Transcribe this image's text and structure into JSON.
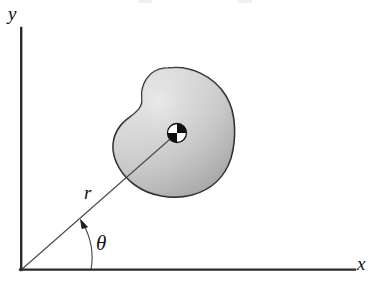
{
  "figure": {
    "background_color": "#ffffff",
    "width": 379,
    "height": 282
  },
  "axes": {
    "origin": {
      "x": 21,
      "y": 270
    },
    "x_axis": {
      "label": "x",
      "label_position": {
        "x": 357,
        "y": 254
      },
      "from": {
        "x": 21,
        "y": 270
      },
      "to": {
        "x": 355,
        "y": 270
      },
      "color": "#2b2b2b",
      "width": 2.2
    },
    "y_axis": {
      "label": "y",
      "label_position": {
        "x": 8,
        "y": 4
      },
      "from": {
        "x": 21,
        "y": 270
      },
      "to": {
        "x": 21,
        "y": 28
      },
      "color": "#2b2b2b",
      "width": 2.2
    }
  },
  "vectors": {
    "radius": {
      "label": "r",
      "label_position": {
        "x": 84,
        "y": 183
      },
      "from": {
        "x": 21,
        "y": 270
      },
      "to": {
        "x": 177,
        "y": 133
      },
      "color": "#4a4a4a",
      "width": 1.1
    }
  },
  "angle": {
    "label": "θ",
    "label_position": {
      "x": 96,
      "y": 233
    },
    "arc_radius": 70,
    "arc_start": {
      "x": 91,
      "y": 270
    },
    "arc_end": {
      "x": 82,
      "y": 222
    },
    "arrow_head": "at-arc-end-counterclockwise",
    "color": "#4a4a4a",
    "width": 1.1
  },
  "body": {
    "name": "rigid-body-blob",
    "fill_light": "#dedede",
    "fill_mid": "#c9c9c9",
    "fill_dark": "#ababab",
    "outline_color": "#1d1d1d",
    "outline_width": 1.6,
    "bounds": {
      "left": 113,
      "top": 68,
      "right": 233,
      "bottom": 196
    }
  },
  "center_of_mass": {
    "name": "center-of-mass-marker",
    "position": {
      "x": 177,
      "y": 133
    },
    "radius": 9.5,
    "quadrants": {
      "top_left": "#ffffff",
      "top_right": "#101010",
      "bottom_left": "#101010",
      "bottom_right": "#ffffff"
    },
    "outline_color": "#101010"
  },
  "scan_artifacts": {
    "top_marks": 2
  }
}
